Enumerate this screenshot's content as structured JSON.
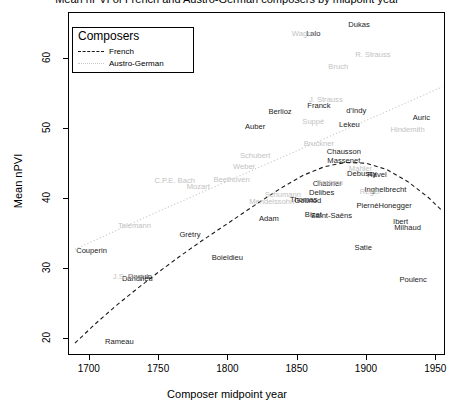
{
  "chart_data": {
    "type": "scatter",
    "title": "Mean nPVI of French and Austro-German composers by midpoint year",
    "xlabel": "Composer midpoint year",
    "ylabel": "Mean nPVI",
    "xlim": [
      1685,
      1957
    ],
    "ylim": [
      17.5,
      66.5
    ],
    "xticks": [
      1700,
      1750,
      1800,
      1850,
      1900,
      1950
    ],
    "yticks": [
      20,
      30,
      40,
      50,
      60
    ],
    "grid": false,
    "legend": {
      "position": "top-left",
      "title": "Composers",
      "entries": [
        {
          "label": "French",
          "style": "dashed",
          "color": "#1a1a1a"
        },
        {
          "label": "Austro-German",
          "style": "dotted",
          "color": "#c9c9c9"
        }
      ]
    },
    "series": [
      {
        "name": "French",
        "color": "#1c1c1c",
        "points": [
          {
            "label": "Couperin",
            "x": 1702,
            "y": 32.3
          },
          {
            "label": "Rameau",
            "x": 1722,
            "y": 19.4
          },
          {
            "label": "Daquin",
            "x": 1737,
            "y": 28.6
          },
          {
            "label": "Dandrieu",
            "x": 1735,
            "y": 28.4
          },
          {
            "label": "Grétry",
            "x": 1773,
            "y": 34.7
          },
          {
            "label": "Boieldieu",
            "x": 1800,
            "y": 31.3
          },
          {
            "label": "Auber",
            "x": 1820,
            "y": 50.1
          },
          {
            "label": "Berlioz",
            "x": 1838,
            "y": 52.2
          },
          {
            "label": "Adam",
            "x": 1830,
            "y": 36.9
          },
          {
            "label": "Thomas",
            "x": 1855,
            "y": 39.6
          },
          {
            "label": "Gounod",
            "x": 1858,
            "y": 39.5
          },
          {
            "label": "Bizet",
            "x": 1862,
            "y": 37.5
          },
          {
            "label": "Delibes",
            "x": 1868,
            "y": 40.6
          },
          {
            "label": "Chabrier",
            "x": 1872,
            "y": 41.9
          },
          {
            "label": "Saint-Saëns",
            "x": 1875,
            "y": 37.4
          },
          {
            "label": "Lalo",
            "x": 1862,
            "y": 63.4
          },
          {
            "label": "Franck",
            "x": 1866,
            "y": 53.1
          },
          {
            "label": "Massenet",
            "x": 1884,
            "y": 45.2
          },
          {
            "label": "Chausson",
            "x": 1884,
            "y": 46.5
          },
          {
            "label": "Dukas",
            "x": 1895,
            "y": 64.7
          },
          {
            "label": "d'Indy",
            "x": 1893,
            "y": 52.4
          },
          {
            "label": "Lekeu",
            "x": 1888,
            "y": 50.4
          },
          {
            "label": "Debussy",
            "x": 1897,
            "y": 43.3
          },
          {
            "label": "Ravel",
            "x": 1908,
            "y": 43.2
          },
          {
            "label": "Satie",
            "x": 1898,
            "y": 32.8
          },
          {
            "label": "Pierné",
            "x": 1901,
            "y": 38.8
          },
          {
            "label": "Inghelbrecht",
            "x": 1914,
            "y": 41.1
          },
          {
            "label": "Honegger",
            "x": 1921,
            "y": 38.8
          },
          {
            "label": "Ibert",
            "x": 1925,
            "y": 36.5
          },
          {
            "label": "Milhaud",
            "x": 1930,
            "y": 35.7
          },
          {
            "label": "Poulenc",
            "x": 1934,
            "y": 28.2
          },
          {
            "label": "Auric",
            "x": 1940,
            "y": 51.3
          }
        ]
      },
      {
        "name": "Austro-German",
        "color": "#c2c2c2",
        "points": [
          {
            "label": "J.S. Bach",
            "x": 1729,
            "y": 28.7
          },
          {
            "label": "Telemann",
            "x": 1733,
            "y": 35.9
          },
          {
            "label": "C.P.E. Bach",
            "x": 1762,
            "y": 42.4
          },
          {
            "label": "Mozart",
            "x": 1779,
            "y": 41.5
          },
          {
            "label": "Beethoven",
            "x": 1803,
            "y": 42.5
          },
          {
            "label": "Weber",
            "x": 1812,
            "y": 44.3
          },
          {
            "label": "Schubert",
            "x": 1820,
            "y": 45.9
          },
          {
            "label": "Mendelssohn",
            "x": 1832,
            "y": 39.3
          },
          {
            "label": "Schumann",
            "x": 1840,
            "y": 40.4
          },
          {
            "label": "Suppé",
            "x": 1862,
            "y": 50.8
          },
          {
            "label": "Bruckner",
            "x": 1866,
            "y": 47.7
          },
          {
            "label": "Wagner",
            "x": 1856,
            "y": 63.3
          },
          {
            "label": "J. Strauss",
            "x": 1871,
            "y": 53.9
          },
          {
            "label": "Brahms",
            "x": 1874,
            "y": 42.1
          },
          {
            "label": "Bruch",
            "x": 1880,
            "y": 58.7
          },
          {
            "label": "Mahler",
            "x": 1896,
            "y": 44.1
          },
          {
            "label": "R. Strauss",
            "x": 1905,
            "y": 60.4
          },
          {
            "label": "Reger",
            "x": 1903,
            "y": 40.8
          },
          {
            "label": "Hindemith",
            "x": 1930,
            "y": 49.6
          }
        ]
      }
    ],
    "trendlines": [
      {
        "name": "French",
        "style": "dashed",
        "color": "#1a1a1a",
        "points": [
          {
            "x": 1690,
            "y": 19.2
          },
          {
            "x": 1705,
            "y": 22.0
          },
          {
            "x": 1720,
            "y": 24.6
          },
          {
            "x": 1735,
            "y": 27.0
          },
          {
            "x": 1750,
            "y": 29.3
          },
          {
            "x": 1765,
            "y": 31.5
          },
          {
            "x": 1780,
            "y": 33.6
          },
          {
            "x": 1795,
            "y": 35.6
          },
          {
            "x": 1810,
            "y": 37.6
          },
          {
            "x": 1825,
            "y": 39.6
          },
          {
            "x": 1840,
            "y": 41.5
          },
          {
            "x": 1855,
            "y": 43.2
          },
          {
            "x": 1870,
            "y": 44.4
          },
          {
            "x": 1885,
            "y": 45.0
          },
          {
            "x": 1900,
            "y": 44.9
          },
          {
            "x": 1915,
            "y": 44.0
          },
          {
            "x": 1930,
            "y": 42.3
          },
          {
            "x": 1945,
            "y": 40.0
          },
          {
            "x": 1955,
            "y": 38.1
          }
        ]
      },
      {
        "name": "Austro-German",
        "style": "dotted",
        "color": "#c9c9c9",
        "points": [
          {
            "x": 1690,
            "y": 32.6
          },
          {
            "x": 1720,
            "y": 35.3
          },
          {
            "x": 1750,
            "y": 38.0
          },
          {
            "x": 1780,
            "y": 40.6
          },
          {
            "x": 1810,
            "y": 43.2
          },
          {
            "x": 1840,
            "y": 45.8
          },
          {
            "x": 1870,
            "y": 48.4
          },
          {
            "x": 1900,
            "y": 51.0
          },
          {
            "x": 1930,
            "y": 53.6
          },
          {
            "x": 1955,
            "y": 55.8
          }
        ]
      }
    ]
  }
}
